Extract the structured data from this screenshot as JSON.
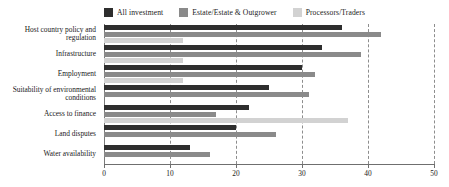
{
  "chart_data": {
    "type": "bar",
    "orientation": "horizontal",
    "title": "",
    "subtitle": "",
    "xlabel": "",
    "ylabel": "",
    "xlim": [
      0,
      50
    ],
    "ylim": null,
    "grid": true,
    "grid_axis": "x",
    "legend_position": "top",
    "xticks": [
      0,
      10,
      20,
      30,
      40,
      50
    ],
    "xticklabels": [
      "0",
      "10",
      "20",
      "30",
      "40",
      "50"
    ],
    "categories": [
      "Host country policy and regulation",
      "Infrastructure",
      "Employment",
      "Suitability of environmental conditions",
      "Access to finance",
      "Land disputes",
      "Water availability"
    ],
    "series": [
      {
        "name": "All investment",
        "color": "#2e2e2e",
        "values": [
          36,
          33,
          30,
          25,
          22,
          20,
          13
        ]
      },
      {
        "name": "Estate/Estate & Outgrower",
        "color": "#8a8a8a",
        "values": [
          42,
          39,
          32,
          31,
          17,
          26,
          16
        ]
      },
      {
        "name": "Processors/Traders",
        "color": "#d2d2d2",
        "values": [
          12,
          12,
          12,
          0,
          37,
          0,
          0
        ]
      }
    ]
  },
  "legend": {
    "items": [
      {
        "label": "All investment",
        "color": "#2e2e2e"
      },
      {
        "label": "Estate/Estate & Outgrower",
        "color": "#8a8a8a"
      },
      {
        "label": "Processors/Traders",
        "color": "#d2d2d2"
      }
    ]
  },
  "axis": {
    "x": {
      "ticks": [
        "0",
        "10",
        "20",
        "30",
        "40",
        "50"
      ]
    },
    "y": {
      "labels": [
        "Host country policy and regulation",
        "Infrastructure",
        "Employment",
        "Suitability of environmental conditions",
        "Access to finance",
        "Land disputes",
        "Water availability"
      ]
    }
  }
}
